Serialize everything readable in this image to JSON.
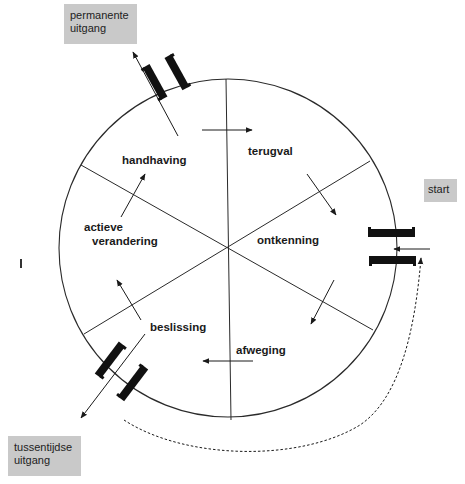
{
  "diagram": {
    "title": "",
    "type": "cycle",
    "stages": [
      {
        "id": "terugval",
        "label": "terugval"
      },
      {
        "id": "ontkenning",
        "label": "ontkenning"
      },
      {
        "id": "afweging",
        "label": "afweging"
      },
      {
        "id": "beslissing",
        "label": "beslissing"
      },
      {
        "id": "actieve-verandering",
        "label_line1": "actieve",
        "label_line2": "verandering"
      },
      {
        "id": "handhaving",
        "label": "handhaving"
      }
    ],
    "entry": {
      "label": "start"
    },
    "exits": [
      {
        "id": "permanente-uitgang",
        "line1": "permanente",
        "line2": "uitgang"
      },
      {
        "id": "tussentijdse-uitgang",
        "line1": "tussentijdse",
        "line2": "uitgang"
      }
    ],
    "flow": [
      "start -> ontkenning",
      "ontkenning -> afweging",
      "afweging -> beslissing",
      "beslissing -> actieve verandering",
      "beslissing -> tussentijdse uitgang",
      "actieve verandering -> handhaving",
      "handhaving -> terugval",
      "handhaving -> permanente uitgang",
      "terugval -> ontkenning",
      "tussentijdse uitgang -> start (dashed)"
    ],
    "colors": {
      "box_fill": "#c9c9c9",
      "line": "#1a1a1a",
      "door": "#111111"
    }
  }
}
